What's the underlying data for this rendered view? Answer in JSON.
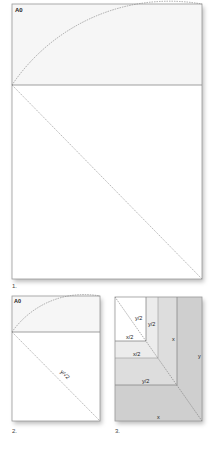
{
  "figures": [
    {
      "number_label": "1.",
      "sheet_label": "A0"
    },
    {
      "number_label": "2.",
      "sheet_label": "A0",
      "diagonal_label": "y/√2"
    },
    {
      "number_label": "3.",
      "region_labels": {
        "inner_y2": "y/2",
        "inner_x2": "x/2",
        "second_y2": "y/2",
        "second_x2": "x/2",
        "third_x": "x",
        "third_y2": "y/2",
        "outer_y": "y",
        "outer_x": "x"
      }
    }
  ],
  "colors": {
    "sheet_top": "#f6f6f6",
    "sheet_bottom": "#ffffff",
    "border": "#999999",
    "dash": "#888888",
    "region_1": "#ffffff",
    "region_2": "#ececec",
    "region_3": "#dddddd",
    "region_4": "#cfcfcf"
  }
}
